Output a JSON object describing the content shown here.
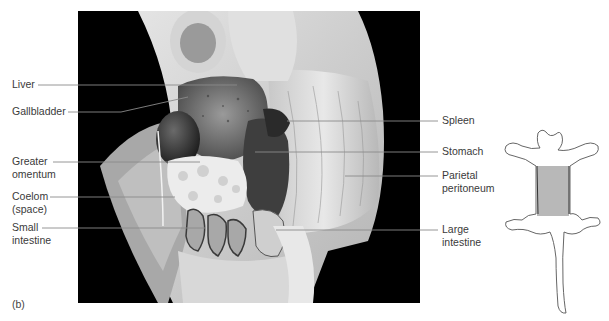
{
  "figure": {
    "panel_label": "(b)",
    "photo_description": "Dissected rat ventral view showing abdominal organs on black background",
    "colors": {
      "background": "#000000",
      "leader_line": "#8a8a8a",
      "label_text": "#3a3a3a",
      "highlight_region": "#b8b8b8",
      "outline": "#555555"
    }
  },
  "labels": {
    "left": [
      {
        "id": "liver",
        "lines": [
          "Liver"
        ]
      },
      {
        "id": "gallbladder",
        "lines": [
          "Gallbladder"
        ]
      },
      {
        "id": "greater-omentum",
        "lines": [
          "Greater",
          "omentum"
        ]
      },
      {
        "id": "coelom",
        "lines": [
          "Coelom",
          "(space)"
        ]
      },
      {
        "id": "small-intestine",
        "lines": [
          "Small",
          "intestine"
        ]
      }
    ],
    "right": [
      {
        "id": "spleen",
        "lines": [
          "Spleen"
        ]
      },
      {
        "id": "stomach",
        "lines": [
          "Stomach"
        ]
      },
      {
        "id": "parietal-peritoneum",
        "lines": [
          "Parietal",
          "peritoneum"
        ]
      },
      {
        "id": "large-intestine",
        "lines": [
          "Large",
          "intestine"
        ]
      }
    ]
  },
  "orientation_diagram": {
    "description": "Rat body outline with shaded abdominal region indicating dissection area"
  }
}
